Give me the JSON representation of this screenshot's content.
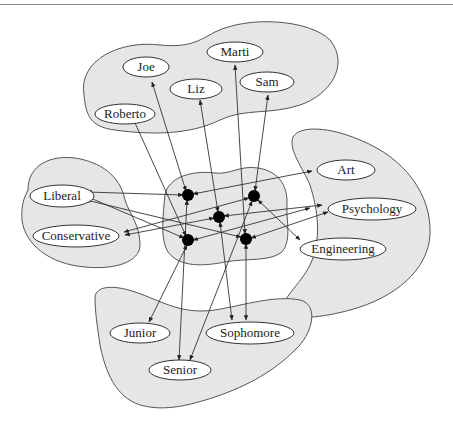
{
  "diagram": {
    "type": "bipartite-association-graph",
    "colors": {
      "cluster_fill": "#e6e6e6",
      "cluster_stroke": "#555555",
      "node_fill": "#ffffff",
      "hub_fill": "#000000",
      "edge": "#333333"
    },
    "clusters": [
      {
        "id": "people",
        "nodes": [
          "Joe",
          "Marti",
          "Liz",
          "Sam",
          "Roberto"
        ]
      },
      {
        "id": "politics",
        "nodes": [
          "Liberal",
          "Conservative"
        ]
      },
      {
        "id": "hubs",
        "nodes": [
          "hub1",
          "hub2",
          "hub3",
          "hub4",
          "hub5"
        ]
      },
      {
        "id": "majors",
        "nodes": [
          "Art",
          "Psychology",
          "Engineering"
        ]
      },
      {
        "id": "year",
        "nodes": [
          "Junior",
          "Sophomore",
          "Senior"
        ]
      }
    ],
    "nodes": {
      "joe": {
        "label": "Joe"
      },
      "marti": {
        "label": "Marti"
      },
      "liz": {
        "label": "Liz"
      },
      "sam": {
        "label": "Sam"
      },
      "roberto": {
        "label": "Roberto"
      },
      "liberal": {
        "label": "Liberal"
      },
      "conservative": {
        "label": "Conservative"
      },
      "art": {
        "label": "Art"
      },
      "psychology": {
        "label": "Psychology"
      },
      "engineering": {
        "label": "Engineering"
      },
      "junior": {
        "label": "Junior"
      },
      "sophomore": {
        "label": "Sophomore"
      },
      "senior": {
        "label": "Senior"
      }
    },
    "hubs": [
      "hub1",
      "hub2",
      "hub3",
      "hub4",
      "hub5"
    ],
    "edges": [
      {
        "from": "hub1",
        "to": "Joe"
      },
      {
        "from": "hub1",
        "to": "Liberal"
      },
      {
        "from": "hub1",
        "to": "Art"
      },
      {
        "from": "hub1",
        "to": "Senior"
      },
      {
        "from": "hub2",
        "to": "Liz"
      },
      {
        "from": "hub2",
        "to": "Conservative"
      },
      {
        "from": "hub2",
        "to": "Psychology"
      },
      {
        "from": "hub2",
        "to": "Sophomore"
      },
      {
        "from": "hub3",
        "to": "Sam"
      },
      {
        "from": "hub3",
        "to": "Engineering"
      },
      {
        "from": "hub3",
        "to": "Conservative"
      },
      {
        "from": "hub3",
        "to": "Senior"
      },
      {
        "from": "hub4",
        "to": "Roberto"
      },
      {
        "from": "hub4",
        "to": "Liberal"
      },
      {
        "from": "hub4",
        "to": "Engineering"
      },
      {
        "from": "hub4",
        "to": "Junior"
      },
      {
        "from": "hub5",
        "to": "Marti"
      },
      {
        "from": "hub5",
        "to": "Liberal"
      },
      {
        "from": "hub5",
        "to": "Psychology"
      },
      {
        "from": "hub5",
        "to": "Sophomore"
      }
    ]
  }
}
